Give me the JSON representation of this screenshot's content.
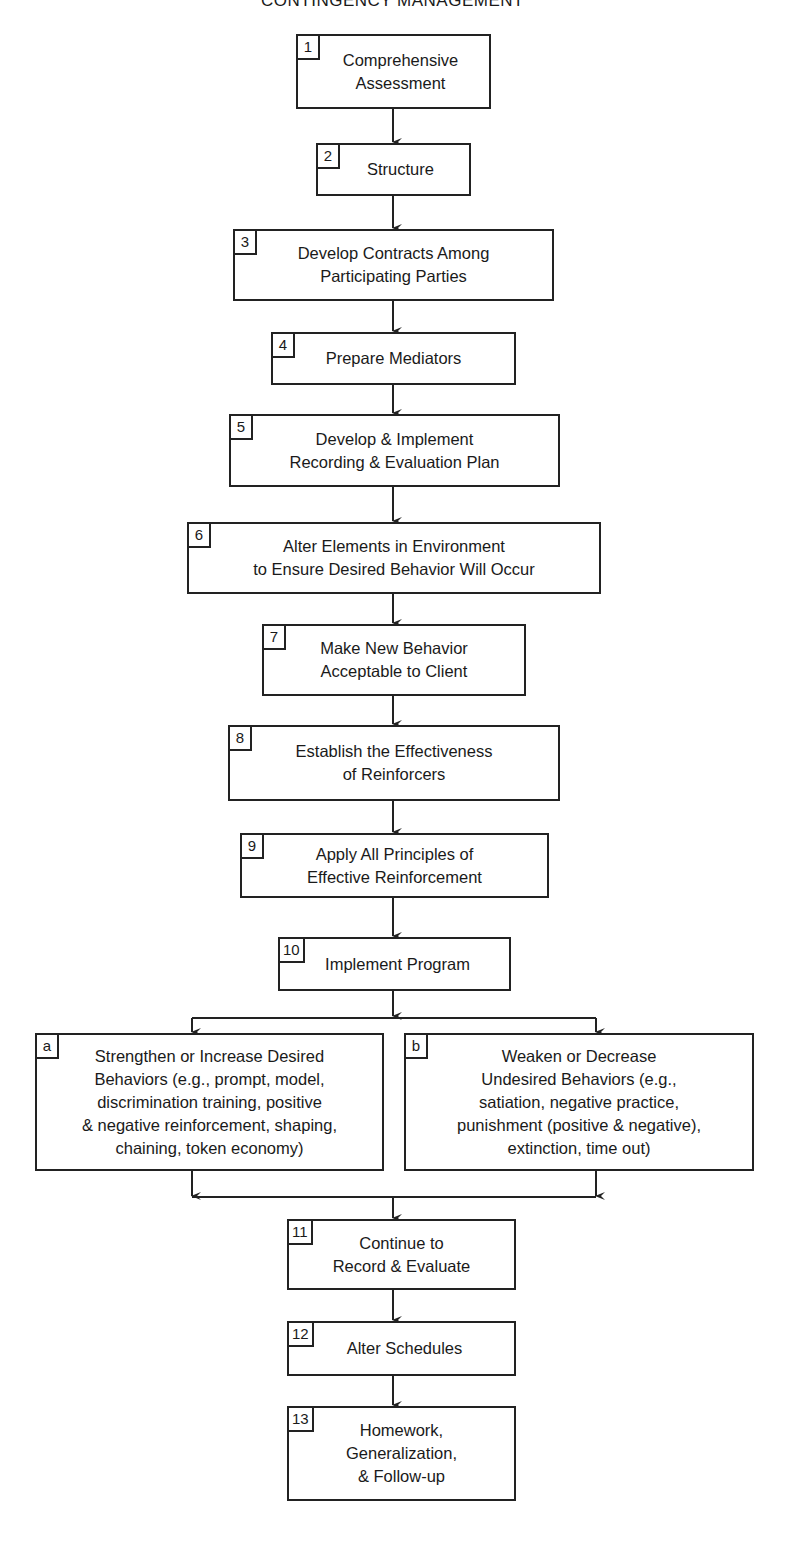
{
  "title": "CONTINGENCY MANAGEMENT",
  "steps": [
    {
      "id": "1",
      "label": "Comprehensive\nAssessment"
    },
    {
      "id": "2",
      "label": "Structure"
    },
    {
      "id": "3",
      "label": "Develop Contracts Among\nParticipating Parties"
    },
    {
      "id": "4",
      "label": "Prepare Mediators"
    },
    {
      "id": "5",
      "label": "Develop & Implement\nRecording & Evaluation Plan"
    },
    {
      "id": "6",
      "label": "Alter Elements in Environment\nto Ensure Desired Behavior Will Occur"
    },
    {
      "id": "7",
      "label": "Make New Behavior\nAcceptable to Client"
    },
    {
      "id": "8",
      "label": "Establish the Effectiveness\nof Reinforcers"
    },
    {
      "id": "9",
      "label": "Apply All Principles of\nEffective Reinforcement"
    },
    {
      "id": "10",
      "label": "Implement Program"
    },
    {
      "id": "11",
      "label": "Continue to\nRecord & Evaluate"
    },
    {
      "id": "12",
      "label": "Alter Schedules"
    },
    {
      "id": "13",
      "label": "Homework,\nGeneralization,\n& Follow-up"
    }
  ],
  "branches": [
    {
      "id": "a",
      "label": "Strengthen or Increase Desired\nBehaviors (e.g., prompt, model,\ndiscrimination training, positive\n& negative reinforcement, shaping,\nchaining, token economy)"
    },
    {
      "id": "b",
      "label": "Weaken or Decrease\nUndesired Behaviors (e.g.,\nsatiation, negative practice,\npunishment (positive & negative),\nextinction, time out)"
    }
  ]
}
